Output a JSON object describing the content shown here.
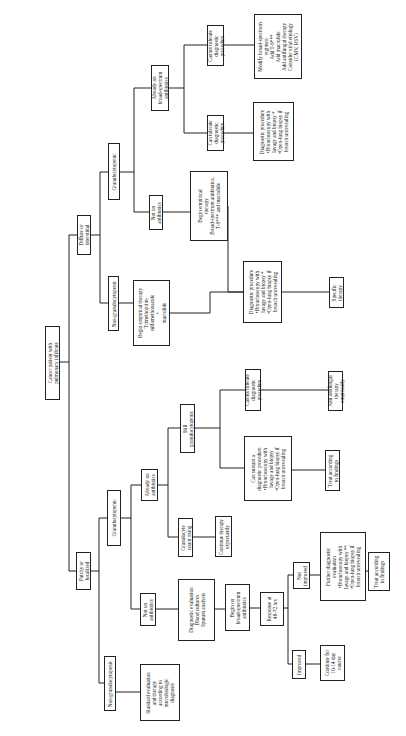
{
  "diagram": {
    "type": "flowchart-tree",
    "orientation": "rotated-90-ccw",
    "line_color": "#222222",
    "nodes": [
      {
        "id": "root",
        "label": "Cancer patient with\npulmonary infiltrate",
        "x": 45,
        "y": 326,
        "w": 15,
        "h": 74
      },
      {
        "id": "diffuse",
        "label": "Diffuse or\ninterstitial",
        "x": 77,
        "y": 215,
        "w": 14,
        "h": 40
      },
      {
        "id": "patchy",
        "label": "Patchy or\nlocalized",
        "x": 76,
        "y": 552,
        "w": 15,
        "h": 38
      },
      {
        "id": "d_gran",
        "label": "Granulocytopenic",
        "x": 108,
        "y": 143,
        "w": 12,
        "h": 57
      },
      {
        "id": "d_nongran",
        "label": "Non-granulocytopenic",
        "x": 108,
        "y": 276,
        "w": 11,
        "h": 55
      },
      {
        "id": "d_already",
        "label": "Already on\nbroad-spectrum\nantibiotics",
        "x": 151,
        "y": 65,
        "w": 18,
        "h": 46
      },
      {
        "id": "d_noton",
        "label": "Not on\nantibiotics",
        "x": 149,
        "y": 195,
        "w": 14,
        "h": 35
      },
      {
        "id": "d_cannot",
        "label": "Cannot tolerate\ndiagnostic\nprocedure",
        "x": 207,
        "y": 25,
        "w": 17,
        "h": 41
      },
      {
        "id": "d_can",
        "label": "Can tolerate\ndiagnostic\nprocedure",
        "x": 207,
        "y": 115,
        "w": 17,
        "h": 36
      },
      {
        "id": "d_modify",
        "label": "Modify broad-spectrum\nregimen\nAdd T-S***\nAdd macrolide\nAdd antifungal therapy\nConsider viral etiology\n(CMV, RSV)",
        "x": 254,
        "y": 14,
        "w": 48,
        "h": 65
      },
      {
        "id": "d_diagtop",
        "label": "Diagnostic procedure\n•Bronchoscopy with\nlavage and biopsy *\n•Open-lung biopsy if\nbronch unrevealing",
        "x": 253,
        "y": 102,
        "w": 41,
        "h": 59
      },
      {
        "id": "d_beginbroad",
        "label": "Begin empirical\ntherapy\nBroad-spectrum antibiotics,\nT-S*** and macrolide",
        "x": 190,
        "y": 171,
        "w": 38,
        "h": 70
      },
      {
        "id": "d_begintmp",
        "label": "Begin empirical therapy\nTrimethoprim-\nsulfamethoxazole\n+\nmacrolide",
        "x": 133,
        "y": 280,
        "w": 37,
        "h": 66
      },
      {
        "id": "d_diagmid",
        "label": "Diagnostic procedure\n•Bronchoscopy with\nlavage and biopsy *\n•Open-lung biopsy if\nbronch unrevealing",
        "x": 243,
        "y": 261,
        "w": 39,
        "h": 62
      },
      {
        "id": "d_specific",
        "label": "Specific\ntherapy",
        "x": 329,
        "y": 277,
        "w": 15,
        "h": 31
      },
      {
        "id": "p_gran",
        "label": "Granulocytopenic",
        "x": 107,
        "y": 490,
        "w": 14,
        "h": 56
      },
      {
        "id": "p_nongran",
        "label": "Non-granulocytopenic",
        "x": 104,
        "y": 656,
        "w": 12,
        "h": 55
      },
      {
        "id": "p_already",
        "label": "Already on\nantibiotics",
        "x": 141,
        "y": 469,
        "w": 17,
        "h": 32
      },
      {
        "id": "p_noton",
        "label": "Not on\nantibiotics",
        "x": 140,
        "y": 593,
        "w": 16,
        "h": 33
      },
      {
        "id": "p_still",
        "label": "Still\ngranulocytopenic",
        "x": 180,
        "y": 404,
        "w": 15,
        "h": 49
      },
      {
        "id": "p_rising",
        "label": "Granulocyte\ncount rising",
        "x": 178,
        "y": 518,
        "w": 15,
        "h": 39
      },
      {
        "id": "p_continue",
        "label": "Continue therapy\nexpectantly",
        "x": 215,
        "y": 516,
        "w": 17,
        "h": 41
      },
      {
        "id": "p_cannot",
        "label": "Cannot tolerate\ndiagnostic\nprocedure",
        "x": 245,
        "y": 369,
        "w": 16,
        "h": 42
      },
      {
        "id": "p_cansustain",
        "label": "Can sustain a\ndiagnostic procedure\n•Bronchoscopy with\nlavage and biopsy\n•Open-lung biopsy if\nbronch unrevealing",
        "x": 244,
        "y": 436,
        "w": 48,
        "h": 65
      },
      {
        "id": "p_antifungal",
        "label": "Add antifungal\ntherapy\nempirically",
        "x": 328,
        "y": 371,
        "w": 15,
        "h": 40
      },
      {
        "id": "p_treat1",
        "label": "Treat according\nto findings",
        "x": 325,
        "y": 450,
        "w": 15,
        "h": 41
      },
      {
        "id": "p_standard",
        "label": "Standard evaluation\nand therapy\naccording to\nmicrobiologic\ndiagnosis",
        "x": 140,
        "y": 664,
        "w": 40,
        "h": 57
      },
      {
        "id": "p_diageval",
        "label": "Diagnostic evaluation\nBlood cultures\nSputum analysis",
        "x": 178,
        "y": 579,
        "w": 37,
        "h": 62
      },
      {
        "id": "p_beginbroad",
        "label": "Begin on\nbroad-spectrum\nantibiotics",
        "x": 225,
        "y": 584,
        "w": 25,
        "h": 47
      },
      {
        "id": "p_response",
        "label": "Response at\n48-72 hrs",
        "x": 260,
        "y": 592,
        "w": 24,
        "h": 34
      },
      {
        "id": "p_notimproved",
        "label": "Not\nimproved",
        "x": 293,
        "y": 562,
        "w": 17,
        "h": 27
      },
      {
        "id": "p_improved",
        "label": "Improved",
        "x": 292,
        "y": 650,
        "w": 14,
        "h": 29
      },
      {
        "id": "p_further",
        "label": "Further diagnostic\nevaluation\n•Bronchoscopy with\nlavage and biopsy **\n•Open-lung biopsy if\nbronch unrevealing",
        "x": 320,
        "y": 532,
        "w": 46,
        "h": 69
      },
      {
        "id": "p_treat2",
        "label": "Treat according\nto findings",
        "x": 368,
        "y": 552,
        "w": 22,
        "h": 39
      },
      {
        "id": "p_continue1014",
        "label": "Continue for\n10-14 day\ncourse",
        "x": 320,
        "y": 645,
        "w": 25,
        "h": 36
      }
    ]
  }
}
